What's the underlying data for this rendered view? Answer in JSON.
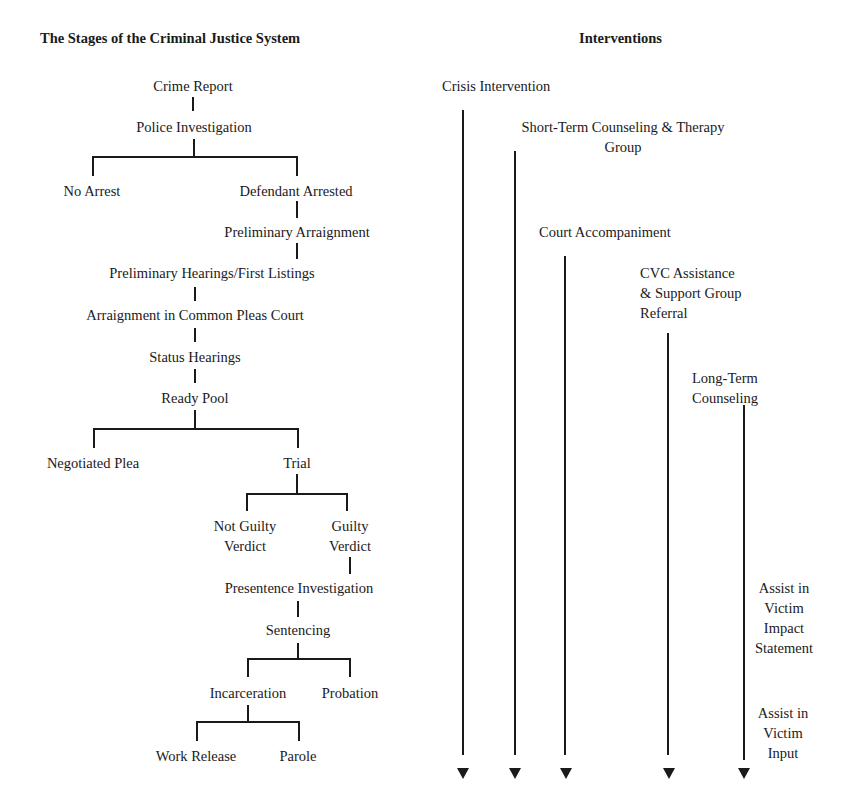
{
  "headings": {
    "left": "The Stages of the Criminal Justice System",
    "right": "Interventions"
  },
  "stages": {
    "crime_report": "Crime Report",
    "police_investigation": "Police Investigation",
    "no_arrest": "No Arrest",
    "defendant_arrested": "Defendant Arrested",
    "preliminary_arraignment": "Preliminary Arraignment",
    "preliminary_hearings": "Preliminary Hearings/First Listings",
    "arraignment_common_pleas": "Arraignment in Common Pleas Court",
    "status_hearings": "Status Hearings",
    "ready_pool": "Ready Pool",
    "negotiated_plea": "Negotiated Plea",
    "trial": "Trial",
    "not_guilty_1": "Not Guilty",
    "not_guilty_2": "Verdict",
    "guilty_1": "Guilty",
    "guilty_2": "Verdict",
    "presentence_investigation": "Presentence Investigation",
    "sentencing": "Sentencing",
    "incarceration": "Incarceration",
    "probation": "Probation",
    "work_release": "Work Release",
    "parole": "Parole"
  },
  "interventions": {
    "crisis_intervention": "Crisis Intervention",
    "short_term_1": "Short-Term Counseling & Therapy",
    "short_term_2": "Group",
    "court_accompaniment": "Court Accompaniment",
    "cvc_1": "CVC Assistance",
    "cvc_2": "& Support Group",
    "cvc_3": "Referral",
    "long_term_1": "Long-Term",
    "long_term_2": "Counseling",
    "impact_1": "Assist in",
    "impact_2": "Victim",
    "impact_3": "Impact",
    "impact_4": "Statement",
    "input_1": "Assist in",
    "input_2": "Victim",
    "input_3": "Input"
  }
}
